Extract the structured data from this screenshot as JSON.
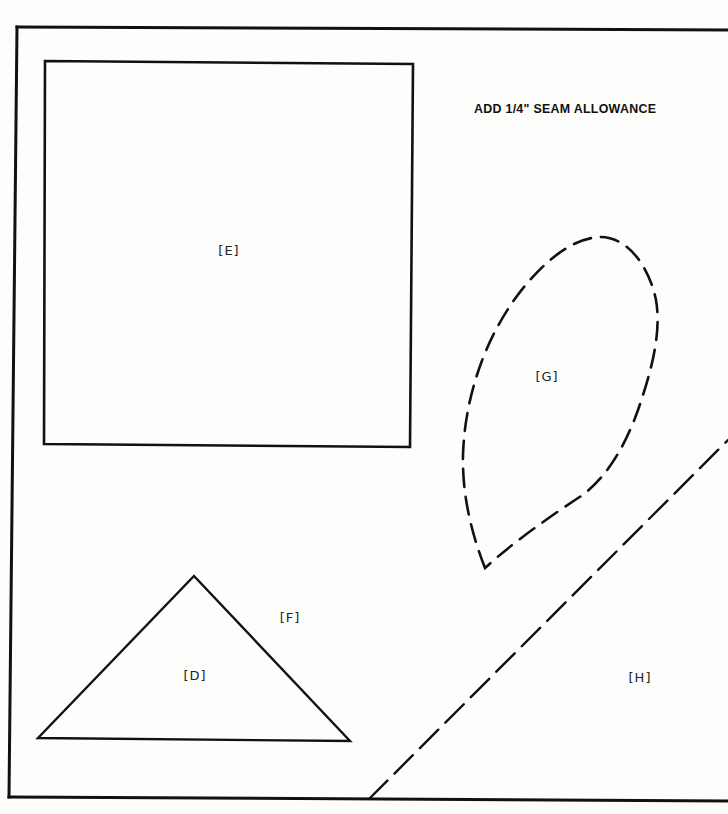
{
  "instruction": "ADD 1/4\" SEAM ALLOWANCE",
  "pieces": {
    "E": {
      "label": "[E]",
      "shape": "square",
      "outline": "solid"
    },
    "G": {
      "label": "[G]",
      "shape": "teardrop",
      "outline": "dashed"
    },
    "D": {
      "label": "[D]",
      "shape": "triangle",
      "outline": "solid"
    },
    "F": {
      "label": "[F]",
      "shape": "region",
      "outline": "none"
    },
    "H": {
      "label": "[H]",
      "shape": "region",
      "outline": "dashed-diagonal"
    }
  },
  "colors": {
    "line": "#111111",
    "paper": "#fdfdfc"
  }
}
